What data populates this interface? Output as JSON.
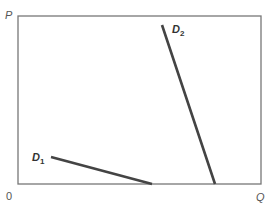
{
  "diagram": {
    "type": "demand-curves",
    "axes": {
      "y_label": "P",
      "x_label": "Q",
      "origin_label": "0"
    },
    "curves": [
      {
        "id": "D1",
        "label_main": "D",
        "label_sub": "1",
        "description": "flatter demand curve (more elastic)"
      },
      {
        "id": "D2",
        "label_main": "D",
        "label_sub": "2",
        "description": "steeper demand curve (less elastic)"
      }
    ],
    "colors": {
      "frame": "#777777",
      "curve": "#444444",
      "text": "#555555"
    }
  }
}
